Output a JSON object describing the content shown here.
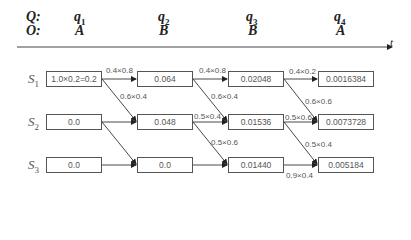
{
  "header": {
    "q_label": "Q:",
    "o_label": "O:",
    "time_axis_label": "t",
    "columns": [
      {
        "q": "q",
        "q_sub": "1",
        "o": "A"
      },
      {
        "q": "q",
        "q_sub": "2",
        "o": "B"
      },
      {
        "q": "q",
        "q_sub": "3",
        "o": "B"
      },
      {
        "q": "q",
        "q_sub": "4",
        "o": "A"
      }
    ]
  },
  "states": [
    {
      "name": "S",
      "sub": "1"
    },
    {
      "name": "S",
      "sub": "2"
    },
    {
      "name": "S",
      "sub": "3"
    }
  ],
  "cells": [
    [
      "1.0×0.2=0.2",
      "0.064",
      "0.02048",
      "0.0016384"
    ],
    [
      "0.0",
      "0.048",
      "0.01536",
      "0.0073728"
    ],
    [
      "0.0",
      "0.0",
      "0.01440",
      "0.005184"
    ]
  ],
  "edges": {
    "t1_s1_s1": "0.4×0.8",
    "t1_s1_s2": "0.6×0.4",
    "t2_s1_s1": "0.4×0.8",
    "t2_s1_s2": "0.6×0.4",
    "t2_s2_s2": "0.5×0.4",
    "t2_s2_s3": "0.5×0.6",
    "t3_s1_s1": "0.4×0.2",
    "t3_s1_s2": "0.6×0.6",
    "t3_s2_s2": "0.5×0.6",
    "t3_s2_s3": "0.5×0.4",
    "t3_s3_s3": "0.9×0.4"
  }
}
